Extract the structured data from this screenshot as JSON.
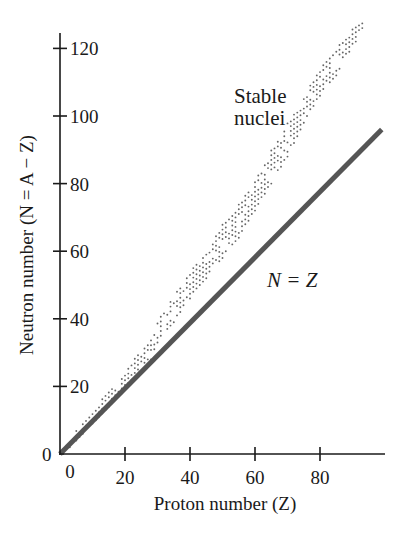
{
  "chart_data": {
    "type": "scatter",
    "title": "",
    "xlabel": "Proton number (Z)",
    "ylabel": "Neutron number (N = A − Z)",
    "xlim": [
      0,
      100
    ],
    "ylim": [
      0,
      130
    ],
    "x_ticks": [
      0,
      20,
      40,
      60,
      80
    ],
    "x_tick_labels": [
      "0",
      "20",
      "40",
      "60",
      "80"
    ],
    "y_ticks": [
      0,
      20,
      40,
      60,
      80,
      100,
      120
    ],
    "y_tick_labels": [
      "0",
      "20",
      "40",
      "60",
      "80",
      "100",
      "120"
    ],
    "grid": false,
    "legend": null,
    "annotations": [
      {
        "text_line1": "Stable",
        "text_line2": "nuclei",
        "x": 52,
        "y": 100
      },
      {
        "text": "N = Z",
        "x": 62,
        "y": 53
      }
    ],
    "series": [
      {
        "name": "N = Z",
        "kind": "line",
        "color": "#555555",
        "points": [
          [
            0,
            0
          ],
          [
            99,
            96
          ]
        ]
      },
      {
        "name": "Stable nuclei",
        "kind": "dotted-band",
        "color": "#666666",
        "band": [
          {
            "z": 1,
            "n_min": 0,
            "n_max": 2
          },
          {
            "z": 5,
            "n_min": 4,
            "n_max": 7
          },
          {
            "z": 10,
            "n_min": 9,
            "n_max": 13
          },
          {
            "z": 15,
            "n_min": 14,
            "n_max": 19
          },
          {
            "z": 20,
            "n_min": 19,
            "n_max": 24
          },
          {
            "z": 25,
            "n_min": 26,
            "n_max": 31
          },
          {
            "z": 28,
            "n_min": 28,
            "n_max": 34
          },
          {
            "z": 30,
            "n_min": 33,
            "n_max": 39
          },
          {
            "z": 35,
            "n_min": 39,
            "n_max": 47
          },
          {
            "z": 40,
            "n_min": 46,
            "n_max": 54
          },
          {
            "z": 45,
            "n_min": 52,
            "n_max": 60
          },
          {
            "z": 50,
            "n_min": 58,
            "n_max": 68
          },
          {
            "z": 55,
            "n_min": 64,
            "n_max": 74
          },
          {
            "z": 60,
            "n_min": 72,
            "n_max": 82
          },
          {
            "z": 65,
            "n_min": 80,
            "n_max": 90
          },
          {
            "z": 70,
            "n_min": 88,
            "n_max": 98
          },
          {
            "z": 75,
            "n_min": 98,
            "n_max": 106
          },
          {
            "z": 80,
            "n_min": 106,
            "n_max": 114
          },
          {
            "z": 85,
            "n_min": 112,
            "n_max": 120
          },
          {
            "z": 90,
            "n_min": 120,
            "n_max": 126
          },
          {
            "z": 93,
            "n_min": 126,
            "n_max": 128
          }
        ]
      }
    ]
  },
  "axes": {
    "y_origin_label": "0",
    "x_origin_label": "0"
  }
}
